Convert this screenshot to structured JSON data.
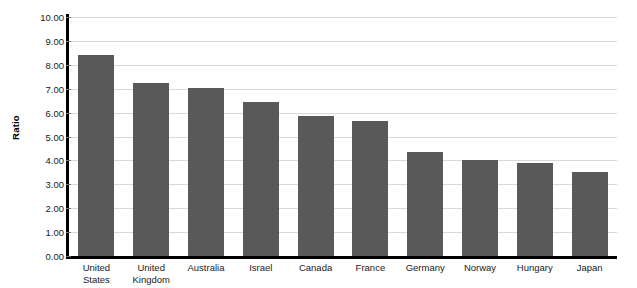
{
  "chart_data": {
    "type": "bar",
    "title": "",
    "xlabel": "",
    "ylabel": "Ratio",
    "ylim": [
      0.0,
      10.0
    ],
    "ytick_step": 1.0,
    "grid": true,
    "legend": "none",
    "bar_color": "#595959",
    "axis_color": "#000000",
    "gridline_color": "#d9d9d9",
    "categories": [
      "United\nStates",
      "United\nKingdom",
      "Australia",
      "Israel",
      "Canada",
      "France",
      "Germany",
      "Norway",
      "Hungary",
      "Japan"
    ],
    "values": [
      8.4,
      7.24,
      7.03,
      6.44,
      5.86,
      5.66,
      4.35,
      4.0,
      3.9,
      3.5
    ],
    "ytick_labels": [
      "10.00",
      "9.00",
      "8.00",
      "7.00",
      "6.00",
      "5.00",
      "4.00",
      "3.00",
      "2.00",
      "1.00",
      "0.00"
    ],
    "ytick_values": [
      10.0,
      9.0,
      8.0,
      7.0,
      6.0,
      5.0,
      4.0,
      3.0,
      2.0,
      1.0,
      0.0
    ]
  },
  "header": {
    "title_sliver": "— ——— —— ————— ———"
  }
}
